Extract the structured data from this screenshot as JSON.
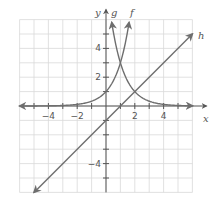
{
  "chart_data": {
    "type": "line",
    "title": "",
    "xlabel": "x",
    "ylabel": "y",
    "xlim": [
      -6,
      6
    ],
    "ylim": [
      -6,
      6
    ],
    "grid": true,
    "xticks": [
      -4,
      -2,
      2,
      4
    ],
    "yticks": [
      -4,
      2,
      4
    ],
    "series": [
      {
        "name": "f",
        "formula": "y = 3^x",
        "points": [
          [
            -6,
            0.0014
          ],
          [
            -2,
            0.111
          ],
          [
            0,
            1
          ],
          [
            1,
            3
          ],
          [
            1.6,
            5.8
          ]
        ]
      },
      {
        "name": "g",
        "formula": "y = 3^(2-x)",
        "points": [
          [
            0.4,
            5.8
          ],
          [
            1,
            3
          ],
          [
            2,
            1
          ],
          [
            4,
            0.111
          ],
          [
            6,
            0.012
          ]
        ]
      },
      {
        "name": "h",
        "formula": "y = x - 1",
        "points": [
          [
            -5,
            -6
          ],
          [
            0,
            -1
          ],
          [
            1,
            0
          ],
          [
            2,
            1
          ],
          [
            6,
            5
          ]
        ]
      }
    ],
    "curve_labels": {
      "f": "f",
      "g": "g",
      "h": "h"
    }
  },
  "axes": {
    "x_label": "x",
    "y_label": "y"
  },
  "tick_labels": {
    "x": [
      "−4",
      "−2",
      "2",
      "4"
    ],
    "y": [
      "4",
      "2",
      "−4"
    ]
  },
  "colors": {
    "curve": "#6e6e6e",
    "grid": "#d9d9d9",
    "axis": "#555555"
  }
}
